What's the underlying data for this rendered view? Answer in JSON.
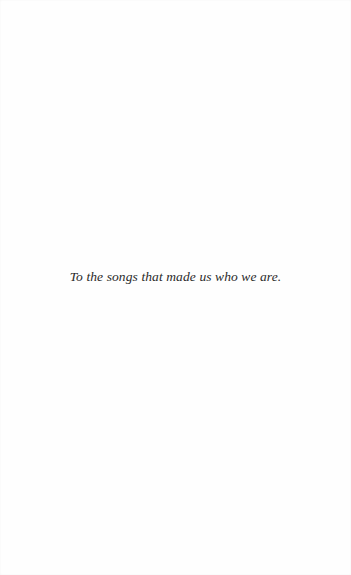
{
  "page": {
    "background": "#fefefe",
    "text_color": "#2a2a2a"
  },
  "dedication": {
    "text": "To the songs that made us who we are."
  }
}
